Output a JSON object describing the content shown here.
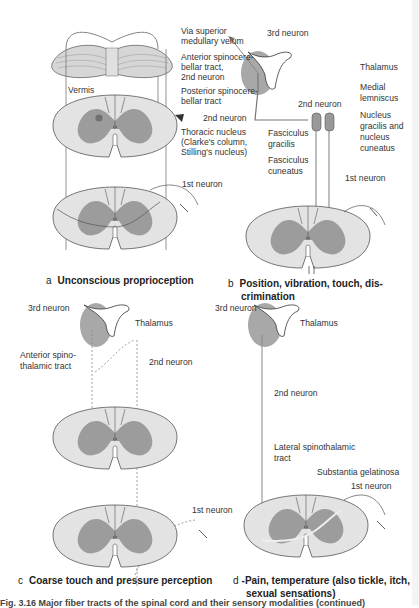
{
  "panels": {
    "a": {
      "letter": "a",
      "caption": "Unconscious proprioception",
      "labels": {
        "via_superior": "Via superior",
        "medullary_velum": "medullary velum",
        "anterior_sc_1": "Anterior spinocere-",
        "anterior_sc_2": "bellar tract,",
        "anterior_sc_3": "2nd neuron",
        "vermis": "Vermis",
        "posterior_sc_1": "Posterior spinocere-",
        "posterior_sc_2": "bellar tract",
        "second_neuron": "2nd neuron",
        "thoracic_1": "Thoracic nucleus",
        "thoracic_2": "(Clarke's column,",
        "thoracic_3": "Stilling's nucleus)",
        "first_neuron": "1st neuron"
      }
    },
    "b": {
      "letter": "b",
      "caption_1": "Position, vibration, touch, dis-",
      "caption_2": "crimination",
      "labels": {
        "third_neuron": "3rd neuron",
        "thalamus": "Thalamus",
        "medial_1": "Medial",
        "medial_2": "lemniscus",
        "second_neuron": "2nd neuron",
        "nucleus_1": "Nucleus",
        "nucleus_2": "gracilis and",
        "nucleus_3": "nucleus",
        "nucleus_4": "cuneatus",
        "fasc_gracilis_1": "Fasciculus",
        "fasc_gracilis_2": "gracilis",
        "fasc_cuneatus_1": "Fasciculus",
        "fasc_cuneatus_2": "cuneatus",
        "first_neuron": "1st neuron"
      }
    },
    "c": {
      "letter": "c",
      "caption": "Coarse touch and pressure perception",
      "labels": {
        "third_neuron": "3rd neuron",
        "thalamus": "Thalamus",
        "anterior_st_1": "Anterior spino-",
        "anterior_st_2": "thalamic tract",
        "second_neuron": "2nd neuron",
        "first_neuron": "1st neuron"
      }
    },
    "d": {
      "letter": "d",
      "caption_1": "-Pain, temperature (also tickle, itch,",
      "caption_2": "sexual sensations)",
      "labels": {
        "third_neuron": "3rd neuron",
        "thalamus": "Thalamus",
        "second_neuron": "2nd neuron",
        "lateral_1": "Lateral spinothalamic",
        "lateral_2": "tract",
        "substantia": "Substantia gelatinosa",
        "first_neuron": "1st neuron"
      }
    }
  },
  "figure_caption": "Fig. 3.16 Major fiber tracts of the spinal cord and their sensory modalities (continued)",
  "colors": {
    "white_matter": "#e3e3e3",
    "gray_matter": "#9c9c9c",
    "outline": "#555555",
    "thalamus": "#a8a8a8",
    "nucleus_dot": "#707070"
  }
}
